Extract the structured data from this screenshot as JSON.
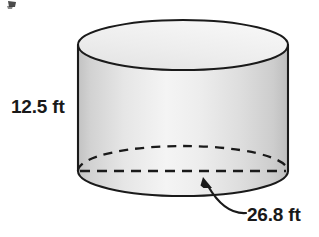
{
  "figure": {
    "shape_name": "cylinder",
    "title": "",
    "labels": {
      "height": "12.5 ft",
      "diameter": "26.8 ft"
    },
    "measurements": [
      {
        "name": "height",
        "value": 12.5,
        "unit": "ft",
        "text": "12.5 ft"
      },
      {
        "name": "diameter",
        "value": 26.8,
        "unit": "ft",
        "text": "26.8 ft"
      }
    ],
    "colors": {
      "outline": "#1a1a1a",
      "body_light": "#f2f2f2",
      "body_mid": "#dcdcdc",
      "body_edge": "#c4c4c4",
      "top_face": "#ececec",
      "text": "#191919",
      "background": "#ffffff"
    },
    "geometry": {
      "center_x": 183,
      "radius_x": 105,
      "radius_y": 25,
      "top_center_y": 45,
      "bottom_center_y": 171
    },
    "annotations": {
      "diameter_leader": "curved arrow pointing to bottom ellipse",
      "bottom_back_arc_style": "dashed",
      "bottom_diameter_style": "dashed"
    }
  }
}
